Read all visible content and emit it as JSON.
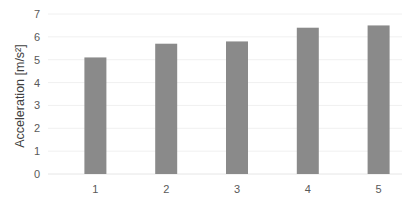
{
  "chart_data": {
    "type": "bar",
    "title": "",
    "xlabel": "",
    "ylabel": "Acceleration [m/s²]",
    "categories": [
      "1",
      "2",
      "3",
      "4",
      "5"
    ],
    "values": [
      5.1,
      5.7,
      5.8,
      6.4,
      6.5
    ],
    "ylim": [
      0,
      7
    ],
    "yticks": [
      0,
      1,
      2,
      3,
      4,
      5,
      6,
      7
    ],
    "grid": true,
    "legend": null,
    "bar_color": "#8a8a8a"
  }
}
